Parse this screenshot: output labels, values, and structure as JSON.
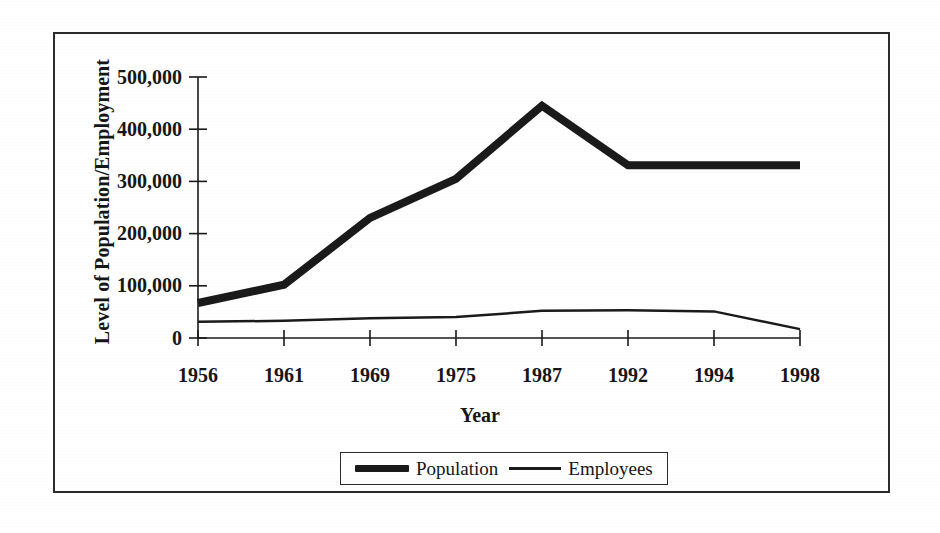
{
  "chart_data": {
    "type": "line",
    "title": "",
    "xlabel": "Year",
    "ylabel": "Level of Population/Employment",
    "categories": [
      "1956",
      "1961",
      "1969",
      "1975",
      "1987",
      "1992",
      "1994",
      "1998"
    ],
    "series": [
      {
        "name": "Population",
        "values": [
          67000,
          102000,
          230000,
          305000,
          445000,
          331000,
          331000,
          331000
        ],
        "style": "thick",
        "color": "#1a1a1a",
        "line_width": 8
      },
      {
        "name": "Employees",
        "values": [
          31000,
          33000,
          38000,
          40000,
          52000,
          53000,
          51000,
          17000
        ],
        "style": "thin",
        "color": "#1a1a1a",
        "line_width": 2.5
      }
    ],
    "ylim": [
      0,
      500000
    ],
    "yticks": [
      0,
      100000,
      200000,
      300000,
      400000,
      500000
    ],
    "ytick_labels": [
      "0",
      "100,000",
      "200,000",
      "300,000",
      "400,000",
      "500,000"
    ],
    "grid": false,
    "legend_position": "bottom-center",
    "axis_color": "#1a1a1a",
    "background": "#ffffff"
  },
  "legend": {
    "entries": [
      {
        "label": "Population",
        "swatch": "thick-line-swatch"
      },
      {
        "label": "Employees",
        "swatch": "thin-line-swatch"
      }
    ]
  }
}
